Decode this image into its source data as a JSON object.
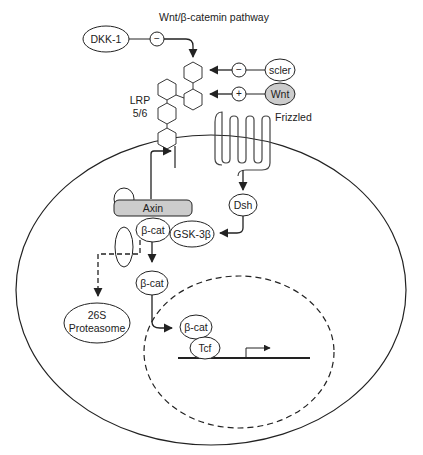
{
  "title": "Wnt/β-catemin pathway",
  "nodes": {
    "dkk1": "DKK-1",
    "scler": "scler",
    "wnt": "Wnt",
    "lrp_line1": "LRP",
    "lrp_line2": "5/6",
    "frizzled": "Frizzled",
    "dsh": "Dsh",
    "axin": "Axin",
    "bcat_complex": "β-cat",
    "gsk3b": "GSK-3β",
    "bcat_free": "β-cat",
    "proteasome_line1": "26S",
    "proteasome_line2": "Proteasome",
    "bcat_nuclear": "β-cat",
    "tcf": "Tcf"
  },
  "signs": {
    "dkk1_sign": "−",
    "scler_sign": "−",
    "wnt_sign": "+"
  },
  "colors": {
    "stroke": "#222222",
    "fill_gray": "#cccccc",
    "background": "#ffffff"
  }
}
